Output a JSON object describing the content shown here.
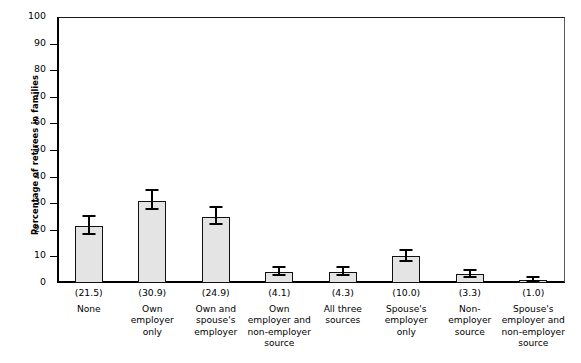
{
  "chart_data": {
    "type": "bar",
    "title": "",
    "xlabel": "",
    "ylabel": "Percentage of retirees in families",
    "ylim": [
      0,
      100
    ],
    "yticks": [
      0,
      10,
      20,
      30,
      40,
      50,
      60,
      70,
      80,
      90,
      100
    ],
    "grid": false,
    "legend": "none",
    "categories": [
      "None",
      "Own employer only",
      "Own and spouse's employer",
      "Own employer and non-employer source",
      "All three sources",
      "Spouse's employer only",
      "Non-employer source",
      "Spouse's employer and non-employer source"
    ],
    "category_lines": [
      [
        "None"
      ],
      [
        "Own",
        "employer",
        "only"
      ],
      [
        "Own and",
        "spouse's",
        "employer"
      ],
      [
        "Own",
        "employer and",
        "non-employer",
        "source"
      ],
      [
        "All three",
        "sources"
      ],
      [
        "Spouse's",
        "employer",
        "only"
      ],
      [
        "Non-employer",
        "source"
      ],
      [
        "Spouse's",
        "employer and",
        "non-employer",
        "source"
      ]
    ],
    "values": [
      21.5,
      30.9,
      24.9,
      4.1,
      4.3,
      10.0,
      3.3,
      1.0
    ],
    "value_labels": [
      "(21.5)",
      "(30.9)",
      "(24.9)",
      "(4.1)",
      "(4.3)",
      "(10.0)",
      "(3.3)",
      "(1.0)"
    ],
    "errors": [
      3.4,
      3.6,
      3.2,
      1.6,
      1.5,
      2.2,
      1.3,
      0.8
    ],
    "bar_fill": "#e4e4e4",
    "bar_stroke": "#111111",
    "error_color": "#000000",
    "axis_color": "#000000",
    "background": "#ffffff"
  }
}
